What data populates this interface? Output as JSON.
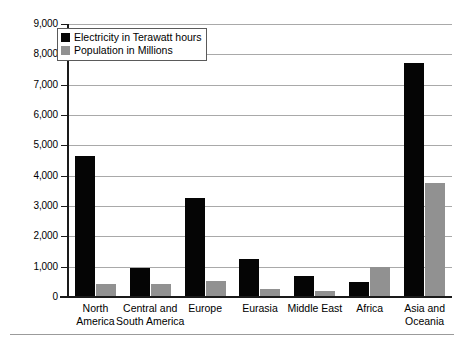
{
  "chart_data": {
    "type": "bar",
    "title": "",
    "subtitle": "",
    "xlabel": "",
    "ylabel": "",
    "ylim": [
      0,
      9000
    ],
    "ytick_step": 1000,
    "grid": true,
    "legend_position": "top-left",
    "categories": [
      "North America",
      "Central and South America",
      "Europe",
      "Eurasia",
      "Middle East",
      "Africa",
      "Asia and Oceania"
    ],
    "category_lines": [
      [
        "North",
        "America"
      ],
      [
        "Central and",
        "South America"
      ],
      [
        "Europe"
      ],
      [
        "Eurasia"
      ],
      [
        "Middle East"
      ],
      [
        "Africa"
      ],
      [
        "Asia and",
        "Oceania"
      ]
    ],
    "ytick_labels": [
      "0",
      "1,000",
      "2,000",
      "3,000",
      "4,000",
      "5,000",
      "6,000",
      "7,000",
      "8,000",
      "9,000"
    ],
    "ytick_values": [
      0,
      1000,
      2000,
      3000,
      4000,
      5000,
      6000,
      7000,
      8000,
      9000
    ],
    "series": [
      {
        "name": "Electricity in Terawatt hours",
        "color": "#050505",
        "values": [
          4640,
          960,
          3280,
          1240,
          700,
          500,
          7700
        ]
      },
      {
        "name": "Population in Millions",
        "color": "#919191",
        "values": [
          430,
          440,
          540,
          250,
          190,
          1000,
          3770
        ]
      }
    ]
  },
  "legend": {
    "items": [
      {
        "label": "Electricity in Terawatt hours",
        "swatch": "electricity"
      },
      {
        "label": "Population in Millions",
        "swatch": "population"
      }
    ]
  },
  "colors": {
    "electricity": "#050505",
    "population": "#919191",
    "gridline": "#a9a9a9",
    "axis": "#1a1a1a",
    "background": "#ffffff"
  }
}
